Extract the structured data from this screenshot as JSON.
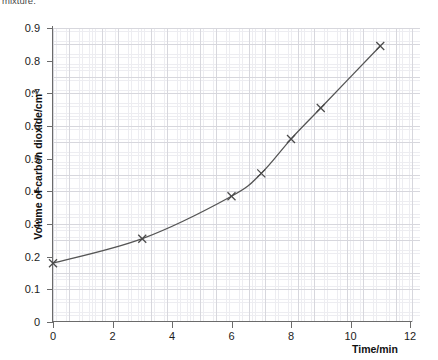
{
  "top_caption": "mixture.",
  "chart_data": {
    "type": "line",
    "title": "",
    "subtitle": "",
    "xlabel": "Time/min",
    "ylabel": "Volume of carbon dioxide/cm3",
    "ylabel_display": "Volume of carbon dioxide/cm",
    "ylabel_superscript": "3",
    "xlim": [
      0,
      12
    ],
    "ylim": [
      0,
      0.9
    ],
    "x_ticks": [
      0,
      2,
      4,
      6,
      8,
      10,
      12
    ],
    "x_tick_labels": [
      "0",
      "2",
      "4",
      "6",
      "8",
      "10",
      "12"
    ],
    "y_ticks": [
      0,
      0.1,
      0.2,
      0.3,
      0.4,
      0.5,
      0.6,
      0.7,
      0.8,
      0.9
    ],
    "y_tick_labels": [
      "0",
      "0.1",
      "0.2",
      "0.3",
      "0.4",
      "0.5",
      "0.6",
      "0.7",
      "0.8",
      "0.9"
    ],
    "grid": "graph-paper-minor-and-major",
    "legend": "none",
    "marker": "x-cross",
    "line_color": "#555555",
    "grid_color_major": "#d7d7dd",
    "grid_color_minor": "#ededf1",
    "axis_color": "#6b6b6b",
    "series": [
      {
        "name": "Volume of carbon dioxide",
        "x": [
          0,
          3,
          6,
          7,
          8,
          9,
          11
        ],
        "values": [
          0.18,
          0.255,
          0.385,
          0.455,
          0.56,
          0.655,
          0.845
        ]
      }
    ]
  }
}
